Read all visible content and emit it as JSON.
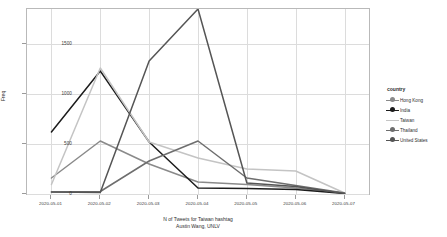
{
  "chart_data": {
    "type": "line",
    "title": "",
    "xlabel": "N of Tweets for Taiwan hashtag",
    "subtitle": "Austin Wang, UNLV",
    "ylabel": "Freq",
    "categories": [
      "2020-05-01",
      "2020-05-02",
      "2020-05-03",
      "2020-05-04",
      "2020-05-05",
      "2020-05-06",
      "2020-05-07"
    ],
    "ylim": [
      0,
      1850
    ],
    "yticks": [
      0,
      500,
      1000,
      1500
    ],
    "ytick_labels": [
      "0",
      "500",
      "1000",
      "1500"
    ],
    "grid": true,
    "legend_position": "right",
    "legend_title": "country",
    "series": [
      {
        "name": "Hong Kong",
        "color": "#8a8a8a",
        "marker": "circle",
        "values": [
          160,
          530,
          300,
          120,
          95,
          60,
          10
        ]
      },
      {
        "name": "India",
        "color": "#1c1c1c",
        "marker": "circle",
        "values": [
          620,
          1230,
          520,
          60,
          55,
          45,
          5
        ]
      },
      {
        "name": "Taiwan",
        "color": "#c4c4c4",
        "marker": "none",
        "values": [
          95,
          1260,
          520,
          360,
          250,
          230,
          10
        ]
      },
      {
        "name": "Thailand",
        "color": "#6e6e6e",
        "marker": "circle",
        "values": [
          20,
          25,
          330,
          530,
          160,
          85,
          10
        ]
      },
      {
        "name": "United States",
        "color": "#555555",
        "marker": "circle",
        "values": [
          20,
          15,
          1330,
          1850,
          110,
          75,
          5
        ]
      }
    ]
  }
}
